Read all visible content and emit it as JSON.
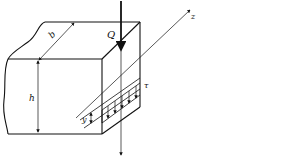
{
  "diagram": {
    "type": "mechanics-beam-section",
    "labels": {
      "width": "b",
      "height": "h",
      "shear_force": "Q",
      "axis": "z",
      "shear_stress": "τ",
      "distance": "y"
    },
    "colors": {
      "line": "#111111",
      "background": "#ffffff"
    }
  }
}
